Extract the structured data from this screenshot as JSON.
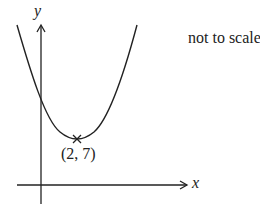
{
  "diagram": {
    "type": "parabola-sketch",
    "note": "not to scale",
    "axes": {
      "x_label": "x",
      "y_label": "y"
    },
    "vertex": {
      "label": "(2, 7)",
      "x": 2,
      "y": 7,
      "marker": "cross"
    },
    "curve": {
      "shape": "upward-opening parabola",
      "crosses_y_axis": true,
      "color": "#222222"
    },
    "colors": {
      "line": "#222222",
      "background": "#ffffff"
    }
  }
}
